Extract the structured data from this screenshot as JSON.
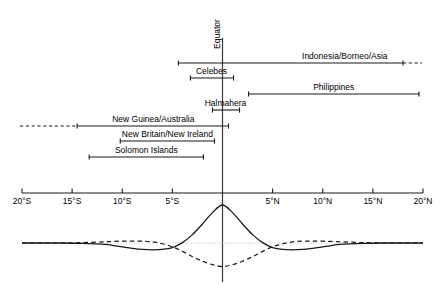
{
  "figure": {
    "equator_label": "Equator",
    "axis": {
      "label_left": "20°S",
      "label_right": "20°N",
      "ticks": [
        {
          "label": "20°S",
          "value": -20
        },
        {
          "label": "15°S",
          "value": -15
        },
        {
          "label": "10°S",
          "value": -10
        },
        {
          "label": "5°S",
          "value": -5
        },
        {
          "label": "5°N",
          "value": 5
        },
        {
          "label": "10°N",
          "value": 10
        },
        {
          "label": "15°N",
          "value": 15
        },
        {
          "label": "20°N",
          "value": 20
        }
      ]
    },
    "ranges": [
      {
        "label": "Indonesia/Borneo/Asia",
        "start": -4.4,
        "end": 18.0,
        "dashed_right": true,
        "dashed_left": false,
        "dashed_end": 19.9,
        "label_x": 12.2
      },
      {
        "label": "Celebes",
        "start": -3.2,
        "end": 1.1,
        "dashed_right": false,
        "dashed_left": false,
        "label_x": -1.1
      },
      {
        "label": "Philippines",
        "start": 2.6,
        "end": 19.6,
        "dashed_right": false,
        "dashed_left": false,
        "label_x": 11.1
      },
      {
        "label": "Halmahera",
        "start": -1.0,
        "end": 1.7,
        "dashed_right": false,
        "dashed_left": false,
        "label_x": 0.3
      },
      {
        "label": "New Guinea/Australia",
        "start": -14.5,
        "end": 0.6,
        "dashed_right": false,
        "dashed_left": true,
        "dashed_end": -20.2,
        "label_x": -6.9
      },
      {
        "label": "New Britain/New Ireland",
        "start": -10.2,
        "end": -0.8,
        "dashed_right": false,
        "dashed_left": false,
        "label_x": -5.5
      },
      {
        "label": "Solomon Islands",
        "start": -13.3,
        "end": -1.9,
        "dashed_right": false,
        "dashed_left": false,
        "label_x": -7.6
      }
    ]
  },
  "chart_data": {
    "type": "line",
    "title": "",
    "xlabel": "",
    "ylabel": "",
    "xlim": [
      -20,
      20
    ],
    "ylim": [
      -1.0,
      1.0
    ],
    "grid": false,
    "legend": "none",
    "x_unit": "degrees latitude",
    "zero_line": true,
    "series": [
      {
        "name": "solid-curve",
        "style": "solid",
        "description": "Mexican-hat wavelet with central positive peak at the equator and shallow negative side lobes",
        "peak_value": 1.0,
        "peak_x": 0,
        "side_lobe_min": -0.18,
        "side_lobe_x": [
          -6.5,
          6.5
        ],
        "x": [
          -20,
          -18,
          -16,
          -14,
          -12,
          -11,
          -10,
          -9,
          -8,
          -7,
          -6,
          -5,
          -4,
          -3,
          -2,
          -1,
          0,
          1,
          2,
          3,
          4,
          5,
          6,
          7,
          8,
          9,
          10,
          11,
          12,
          14,
          16,
          18,
          20
        ],
        "y": [
          0.0,
          0.0,
          0.0,
          -0.01,
          -0.03,
          -0.06,
          -0.1,
          -0.14,
          -0.17,
          -0.18,
          -0.17,
          -0.12,
          0.01,
          0.22,
          0.5,
          0.8,
          1.0,
          0.8,
          0.5,
          0.22,
          0.01,
          -0.12,
          -0.17,
          -0.18,
          -0.17,
          -0.14,
          -0.1,
          -0.06,
          -0.03,
          -0.01,
          0.0,
          0.0,
          0.0
        ]
      },
      {
        "name": "dashed-curve",
        "style": "dashed",
        "description": "Inverted wavelet with central trough at the equator and shallow positive side lobes",
        "trough_value": -0.62,
        "trough_x": 0,
        "side_lobe_max": 0.05,
        "side_lobe_x": [
          -8.0,
          8.0
        ],
        "x": [
          -20,
          -18,
          -16,
          -14,
          -12,
          -11,
          -10,
          -9,
          -8,
          -7,
          -6,
          -5,
          -4,
          -3,
          -2,
          -1,
          0,
          1,
          2,
          3,
          4,
          5,
          6,
          7,
          8,
          9,
          10,
          11,
          12,
          14,
          16,
          18,
          20
        ],
        "y": [
          0.0,
          0.0,
          0.0,
          0.01,
          0.03,
          0.04,
          0.05,
          0.05,
          0.05,
          0.03,
          -0.02,
          -0.1,
          -0.22,
          -0.36,
          -0.48,
          -0.57,
          -0.62,
          -0.57,
          -0.48,
          -0.36,
          -0.22,
          -0.1,
          -0.02,
          0.03,
          0.05,
          0.05,
          0.05,
          0.04,
          0.03,
          0.01,
          0.0,
          0.0,
          0.0
        ]
      }
    ]
  }
}
